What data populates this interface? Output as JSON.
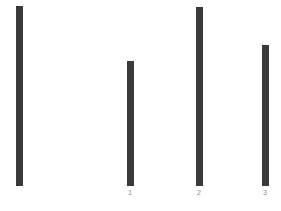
{
  "chart_data": {
    "type": "bar",
    "title": "",
    "subtitle": "",
    "xlabel": "",
    "ylabel": "",
    "grid": false,
    "legend": null,
    "background_color": "#ffffff",
    "bar_color": "#3a3a3c",
    "tick_label_color": "#8a8a8d",
    "axis_line": false,
    "categories": [
      "",
      "1",
      "2",
      "3"
    ],
    "tick_labels": [
      "",
      "1",
      "2",
      "3"
    ],
    "values": [
      180,
      125,
      179,
      141
    ],
    "ylim": [
      0,
      186
    ],
    "bar_width_px": 7,
    "bars": [
      {
        "label": "",
        "value": 180,
        "x": 16,
        "top": 6,
        "height": 180,
        "width": 7
      },
      {
        "label": "1",
        "value": 125,
        "x": 127,
        "top": 61,
        "height": 125,
        "width": 7
      },
      {
        "label": "2",
        "value": 179,
        "x": 196,
        "top": 7,
        "height": 179,
        "width": 7
      },
      {
        "label": "3",
        "value": 141,
        "x": 262,
        "top": 45,
        "height": 141,
        "width": 7
      }
    ],
    "annotations": [
      {
        "name": "bottom-caption",
        "text": "",
        "visible_faint": true
      }
    ]
  },
  "ticks": {
    "tick1": "1",
    "tick2": "2",
    "tick3": "3"
  },
  "caption": {
    "text": ""
  }
}
